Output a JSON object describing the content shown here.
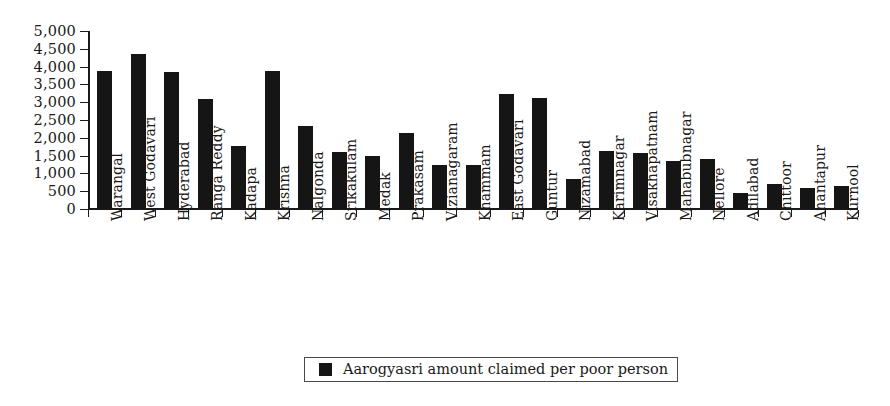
{
  "chart_data": {
    "type": "bar",
    "title": "",
    "subtitle": "",
    "xlabel": "",
    "ylabel": "",
    "ylim": [
      0,
      5000
    ],
    "ytick_values": [
      0,
      500,
      1000,
      1500,
      2000,
      2500,
      3000,
      3500,
      4000,
      4500,
      5000
    ],
    "ytick_labels": [
      "0",
      "500",
      "1,000",
      "1,500",
      "2,000",
      "2,500",
      "3,000",
      "3,500",
      "4,000",
      "4,500",
      "5,000"
    ],
    "grid": false,
    "legend_position": "bottom-center",
    "legend": [
      "Aarogyasri amount claimed per poor person"
    ],
    "series_color": "#151515",
    "categories": [
      "Warangal",
      "West Godavari",
      "Hyderabad",
      "Ranga Reddy",
      "Kadapa",
      "Krishna",
      "Nalgonda",
      "Srikakulam",
      "Medak",
      "Prakasam",
      "Vizianagaram",
      "Khammam",
      "East Godavari",
      "Guntur",
      "Nizamabad",
      "Karimnagar",
      "Visakhapatnam",
      "Mahabubnagar",
      "Nellore",
      "Adilabad",
      "Chittoor",
      "Anantapur",
      "Kurnool"
    ],
    "series": [
      {
        "name": "Aarogyasri amount claimed per poor person",
        "values": [
          3880,
          4360,
          3860,
          3100,
          1780,
          3880,
          2330,
          1600,
          1480,
          2140,
          1240,
          1250,
          3240,
          3120,
          830,
          1620,
          1560,
          1350,
          1400,
          450,
          700,
          600,
          650
        ]
      }
    ]
  },
  "legend": {
    "label": "Aarogyasri amount claimed per poor person"
  }
}
